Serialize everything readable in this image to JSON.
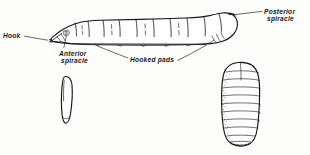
{
  "figure": {
    "ink_color": "#17151a",
    "background_color": "#fdfdfc",
    "labels": {
      "hook": "Hook",
      "anterior_spiracle_line1": "Anterior",
      "anterior_spiracle_line2": "spiracle",
      "hooked_pads": "Hooked pads",
      "posterior_spiracle_line1": "Posterior",
      "posterior_spiracle_line2": "spiracle"
    },
    "specimens": [
      {
        "name": "larva",
        "description": "Segmented maggot shown in lateral view, tapering to a pointed head at left and blunt rounded at right"
      },
      {
        "name": "egg",
        "description": "Small elongate oval egg, lower left"
      },
      {
        "name": "puparium",
        "description": "Barrel-shaped segmented puparium with stippled shading, lower right"
      }
    ]
  }
}
